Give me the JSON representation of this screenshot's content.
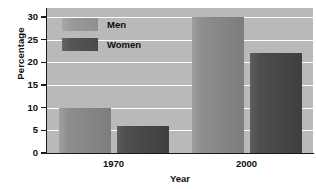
{
  "chart_data": {
    "type": "bar",
    "title": "",
    "xlabel": "Year",
    "ylabel": "Percentage",
    "categories": [
      "1970",
      "2000"
    ],
    "series": [
      {
        "name": "Men",
        "values": [
          10,
          30
        ],
        "color": "#8e8e8e"
      },
      {
        "name": "Women",
        "values": [
          6,
          22
        ],
        "color": "#4e4e4e"
      }
    ],
    "ylim": [
      0,
      32
    ],
    "yticks": [
      0,
      5,
      10,
      15,
      20,
      25,
      30
    ],
    "ytick_labels": [
      "0",
      "5",
      "10",
      "15",
      "20",
      "25",
      "30"
    ],
    "grid": true,
    "grid_axis": "y",
    "legend_position": "upper-left-inside",
    "plot_background": "#b9b9b9",
    "gridline_color": "#fdfdfd",
    "axis_color": "#1a1a1a",
    "figure_background": "#ffffff"
  },
  "legend": {
    "items": [
      {
        "label": "Men",
        "swatch": "men-legend-swatch"
      },
      {
        "label": "Women",
        "swatch": "women-legend-swatch"
      }
    ]
  }
}
